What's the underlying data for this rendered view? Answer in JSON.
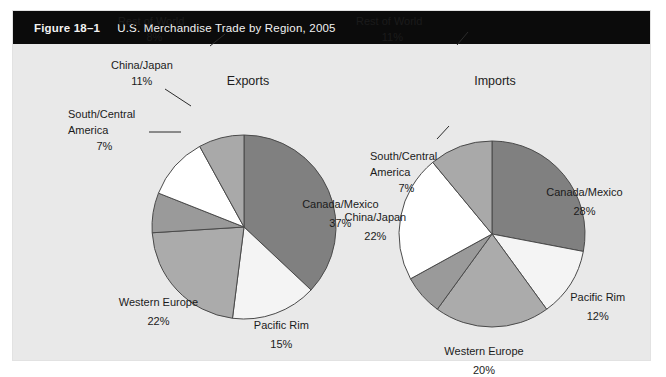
{
  "figure": {
    "number": "Figure 18–1",
    "caption": "U.S. Merchandise Trade by Region, 2005"
  },
  "colors": {
    "panel_background": "#e9e9e9",
    "header_background": "#0b0b0b",
    "header_text": "#f2f2f2",
    "slice_canada_mexico": "#808080",
    "slice_pacific_rim": "#f4f4f4",
    "slice_western_europe": "#ababab",
    "slice_south_central_america": "#9a9a9a",
    "slice_china_japan": "#ffffff",
    "slice_rest_of_world": "#a9a9a9",
    "slice_outline": "#4a4a4a",
    "label_text": "#1b1b1b"
  },
  "chart_data": [
    {
      "type": "pie",
      "title": "Exports",
      "categories": [
        "Canada/Mexico",
        "Pacific Rim",
        "Western Europe",
        "South/Central America",
        "China/Japan",
        "Rest of World"
      ],
      "values": [
        37,
        15,
        22,
        7,
        11,
        8
      ],
      "value_labels": [
        "37%",
        "15%",
        "22%",
        "7%",
        "11%",
        "8%"
      ],
      "unit": "percent",
      "start_angle_deg": 0,
      "direction": "clockwise",
      "legend": "none",
      "slice_colors": [
        "#808080",
        "#f4f4f4",
        "#ababab",
        "#9a9a9a",
        "#ffffff",
        "#a9a9a9"
      ],
      "label_placement": [
        "inside",
        "inside",
        "inside",
        "outside",
        "outside",
        "outside"
      ]
    },
    {
      "type": "pie",
      "title": "Imports",
      "categories": [
        "Canada/Mexico",
        "Pacific Rim",
        "Western Europe",
        "South/Central America",
        "China/Japan",
        "Rest of World"
      ],
      "values": [
        28,
        12,
        20,
        7,
        22,
        11
      ],
      "value_labels": [
        "28%",
        "12%",
        "20%",
        "7%",
        "22%",
        "11%"
      ],
      "unit": "percent",
      "start_angle_deg": 0,
      "direction": "clockwise",
      "legend": "none",
      "slice_colors": [
        "#808080",
        "#f4f4f4",
        "#ababab",
        "#9a9a9a",
        "#ffffff",
        "#a9a9a9"
      ],
      "label_placement": [
        "inside",
        "inside",
        "inside",
        "outside",
        "outside",
        "outside"
      ]
    }
  ]
}
